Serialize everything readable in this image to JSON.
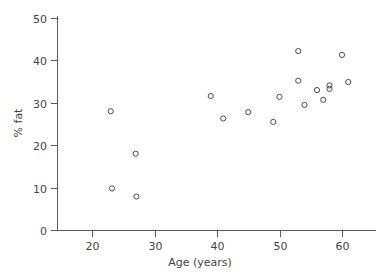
{
  "chart_data": {
    "type": "scatter",
    "title": "",
    "xlabel": "Age (years)",
    "ylabel": "% fat",
    "xlim": [
      14,
      65
    ],
    "ylim": [
      0,
      52
    ],
    "xticks": [
      20,
      30,
      40,
      50,
      60
    ],
    "yticks": [
      0,
      10,
      20,
      30,
      40,
      50
    ],
    "xtick_labels": [
      "20",
      "30",
      "40",
      "50",
      "60"
    ],
    "ytick_labels": [
      "0",
      "10",
      "20",
      "30",
      "40",
      "50"
    ],
    "grid": false,
    "legend": "none",
    "marker": "open-circle",
    "marker_color": "#4a4a52",
    "points": [
      {
        "x": 23.0,
        "y": 28.0
      },
      {
        "x": 23.2,
        "y": 9.8
      },
      {
        "x": 27.0,
        "y": 18.0
      },
      {
        "x": 27.1,
        "y": 7.9
      },
      {
        "x": 39.0,
        "y": 31.6
      },
      {
        "x": 41.0,
        "y": 26.3
      },
      {
        "x": 45.0,
        "y": 27.8
      },
      {
        "x": 49.0,
        "y": 25.5
      },
      {
        "x": 50.0,
        "y": 31.4
      },
      {
        "x": 53.0,
        "y": 42.2
      },
      {
        "x": 53.0,
        "y": 35.2
      },
      {
        "x": 54.0,
        "y": 29.5
      },
      {
        "x": 56.0,
        "y": 33.0
      },
      {
        "x": 57.0,
        "y": 30.7
      },
      {
        "x": 58.0,
        "y": 34.1
      },
      {
        "x": 58.0,
        "y": 33.3
      },
      {
        "x": 60.0,
        "y": 41.3
      },
      {
        "x": 61.0,
        "y": 34.9
      }
    ]
  },
  "figure": {
    "x_axis_title": "Age (years)",
    "y_axis_title": "% fat"
  }
}
